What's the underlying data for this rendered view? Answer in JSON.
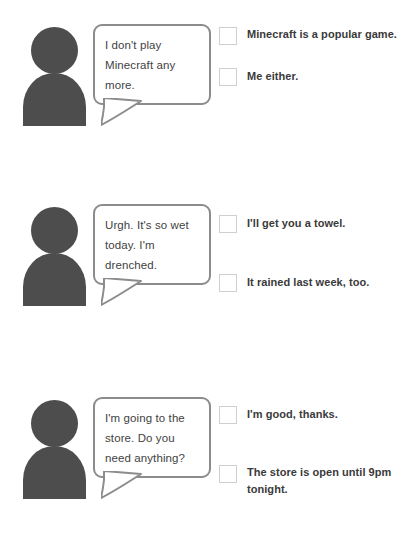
{
  "page": {
    "background_color": "#ffffff",
    "avatar_color": "#4d4d4d",
    "bubble_border_color": "#8c8c8c",
    "checkbox_border_color": "#cfcfcf",
    "text_color": "#3a3a3a"
  },
  "exercises": [
    {
      "speaker_icon": "person-avatar-icon",
      "bubble_text": "I don't play Minecraft any more.",
      "options": [
        {
          "checked": false,
          "label": "Minecraft is a popular game."
        },
        {
          "checked": false,
          "label": "Me either."
        }
      ]
    },
    {
      "speaker_icon": "person-avatar-icon",
      "bubble_text": "Urgh. It's so wet today. I'm drenched.",
      "options": [
        {
          "checked": false,
          "label": "I'll get you a towel."
        },
        {
          "checked": false,
          "label": "It rained last week, too."
        }
      ]
    },
    {
      "speaker_icon": "person-avatar-icon",
      "bubble_text": "I'm going to the store. Do you need anything?",
      "options": [
        {
          "checked": false,
          "label": "I'm good, thanks."
        },
        {
          "checked": false,
          "label": "The store is open until 9pm tonight."
        }
      ]
    }
  ]
}
